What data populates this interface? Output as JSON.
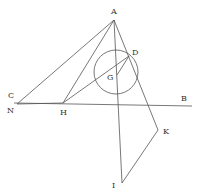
{
  "diagram": {
    "points": {
      "A": {
        "x": 114,
        "y": 20,
        "label": "A",
        "lx": 111,
        "ly": 14
      },
      "D": {
        "x": 129,
        "y": 56,
        "label": "D",
        "lx": 132,
        "ly": 55
      },
      "G": {
        "x": 117,
        "y": 75,
        "label": "G",
        "lx": 107,
        "ly": 80
      },
      "N": {
        "x": 17,
        "y": 104,
        "label": "N",
        "lx": 7,
        "ly": 113
      },
      "C": {
        "x": 14,
        "y": 103,
        "label": "C",
        "lx": 8,
        "ly": 98
      },
      "H": {
        "x": 63,
        "y": 103,
        "label": "H",
        "lx": 60,
        "ly": 115
      },
      "B": {
        "x": 192,
        "y": 106,
        "label": "B",
        "lx": 181,
        "ly": 101
      },
      "K": {
        "x": 158,
        "y": 130,
        "label": "K",
        "lx": 163,
        "ly": 134
      },
      "I": {
        "x": 122,
        "y": 183,
        "label": "I",
        "lx": 112,
        "ly": 188
      }
    },
    "circle": {
      "cx": 116,
      "cy": 72,
      "r": 22
    },
    "segments": [
      [
        "A",
        "N"
      ],
      [
        "A",
        "H"
      ],
      [
        "A",
        "I"
      ],
      [
        "A",
        "K"
      ],
      [
        "H",
        "D"
      ],
      [
        "G",
        "D"
      ],
      [
        "N",
        "H"
      ],
      [
        "C",
        "B"
      ],
      [
        "K",
        "I"
      ]
    ]
  }
}
